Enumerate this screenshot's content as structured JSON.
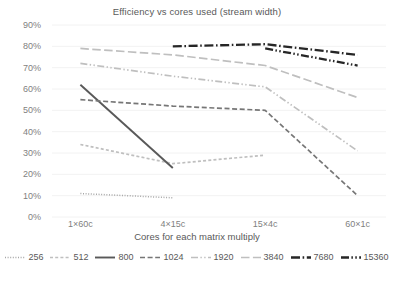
{
  "chart_data": {
    "type": "line",
    "title": "Efficiency vs cores used (stream width)",
    "xlabel": "Cores for each matrix multiply",
    "ylabel": "",
    "categories": [
      "1×60c",
      "4×15c",
      "15×4c",
      "60×1c"
    ],
    "ylim": [
      0,
      0.9
    ],
    "yticks": [
      "0%",
      "10%",
      "20%",
      "30%",
      "40%",
      "50%",
      "60%",
      "70%",
      "80%",
      "90%"
    ],
    "ytick_values": [
      0,
      10,
      20,
      30,
      40,
      50,
      60,
      70,
      80,
      90
    ],
    "grid": true,
    "legend_position": "bottom",
    "value_format": "percent",
    "series": [
      {
        "name": "256",
        "values": [
          11,
          9,
          null,
          null
        ],
        "color": "#a6a6a6",
        "dash": "dotted"
      },
      {
        "name": "512",
        "values": [
          34,
          25,
          29,
          null
        ],
        "color": "#bfbfbf",
        "dash": "short-dash"
      },
      {
        "name": "800",
        "values": [
          62,
          23,
          null,
          null
        ],
        "color": "#595959",
        "dash": "solid"
      },
      {
        "name": "1024",
        "values": [
          55,
          52,
          50,
          10
        ],
        "color": "#767676",
        "dash": "medium-dash"
      },
      {
        "name": "1920",
        "values": [
          72,
          66,
          61,
          31
        ],
        "color": "#bfbfbf",
        "dash": "dash-dot-dot"
      },
      {
        "name": "3840",
        "values": [
          79,
          76,
          71,
          56
        ],
        "color": "#bfbfbf",
        "dash": "long-dash"
      },
      {
        "name": "7680",
        "values": [
          null,
          80,
          81,
          76
        ],
        "color": "#262626",
        "dash": "dash-dot"
      },
      {
        "name": "15360",
        "values": [
          null,
          null,
          79,
          71
        ],
        "color": "#262626",
        "dash": "dash-dot-dot-bold"
      }
    ]
  },
  "legend": {
    "items": [
      {
        "label": "256"
      },
      {
        "label": "512"
      },
      {
        "label": "800"
      },
      {
        "label": "1024"
      },
      {
        "label": "1920"
      },
      {
        "label": "3840"
      },
      {
        "label": "7680"
      },
      {
        "label": "15360"
      }
    ]
  }
}
